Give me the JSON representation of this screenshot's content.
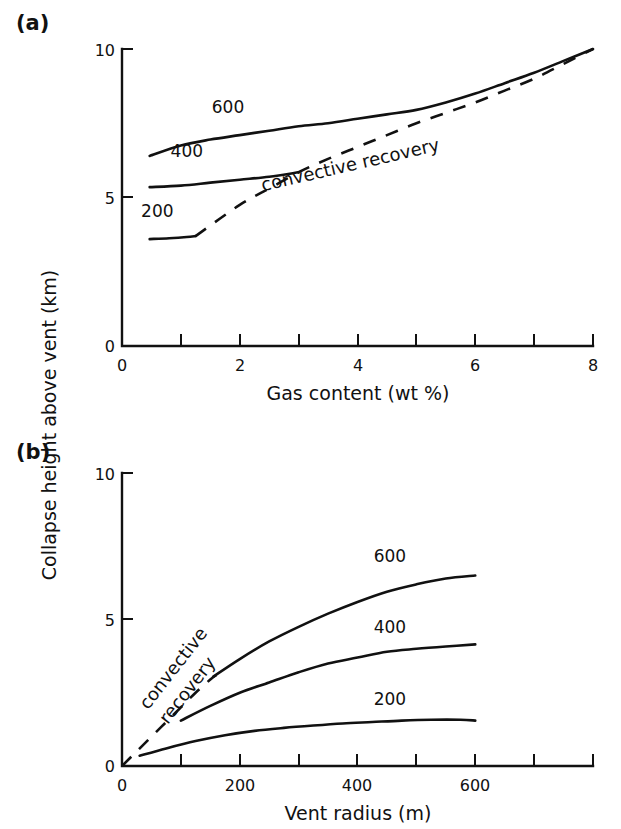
{
  "figure": {
    "panels": [
      {
        "tag": "(a)",
        "xlabel": "Gas content (wt %)",
        "xticks": [
          "0",
          "2",
          "4",
          "6",
          "8"
        ],
        "yticks": [
          "10",
          "5",
          "0"
        ],
        "annotation": "convective recovery",
        "curve_labels": [
          "600",
          "400",
          "200"
        ]
      },
      {
        "tag": "(b)",
        "xlabel": "Vent radius (m)",
        "xticks": [
          "0",
          "200",
          "400",
          "600"
        ],
        "yticks": [
          "10",
          "5",
          "0"
        ],
        "annotation_line1": "convective",
        "annotation_line2": "recovery",
        "curve_labels": [
          "600",
          "400",
          "200"
        ]
      }
    ],
    "ylabel": "Collapse height above vent (km)"
  },
  "chart_data": [
    {
      "type": "line",
      "panel": "(a)",
      "title": "",
      "xlabel": "Gas content (wt %)",
      "ylabel": "Collapse height above vent (km)",
      "xlim": [
        0,
        8
      ],
      "ylim": [
        0,
        10
      ],
      "xticks": [
        0,
        1,
        2,
        3,
        4,
        5,
        6,
        7,
        8
      ],
      "xticklabels": [
        "0",
        "",
        "2",
        "",
        "4",
        "",
        "6",
        "",
        "8"
      ],
      "yticks": [
        0,
        5,
        10
      ],
      "yticklabels": [
        "0",
        "5",
        "10"
      ],
      "grid": false,
      "legend": "inline-curve-labels",
      "series": [
        {
          "name": "600",
          "label_position": [
            1.8,
            7.85
          ],
          "x": [
            0.47,
            1.0,
            1.5,
            2.0,
            2.5,
            3.0,
            3.5,
            4.0,
            4.5,
            5.0,
            5.5,
            6.0,
            6.5,
            7.0,
            7.5,
            8.0
          ],
          "y": [
            6.4,
            6.75,
            6.95,
            7.1,
            7.25,
            7.4,
            7.5,
            7.65,
            7.8,
            7.95,
            8.2,
            8.5,
            8.85,
            9.2,
            9.6,
            10.0
          ]
        },
        {
          "name": "400",
          "label_position": [
            1.1,
            6.35
          ],
          "x": [
            0.47,
            1.0,
            1.5,
            2.0,
            2.5,
            3.0
          ],
          "y": [
            5.35,
            5.4,
            5.5,
            5.6,
            5.7,
            5.85
          ]
        },
        {
          "name": "200",
          "label_position": [
            0.6,
            4.35
          ],
          "x": [
            0.47,
            0.8,
            1.1,
            1.25
          ],
          "y": [
            3.6,
            3.63,
            3.67,
            3.7
          ]
        },
        {
          "name": "convective recovery",
          "style": "dashed",
          "label_position": [
            3.9,
            5.9
          ],
          "label_rotation_deg": -13,
          "x": [
            1.25,
            2.0,
            2.5,
            3.0,
            3.5,
            4.0,
            4.5,
            5.0,
            5.5,
            6.0,
            6.5,
            7.0,
            7.5,
            8.0
          ],
          "y": [
            3.7,
            4.75,
            5.3,
            5.85,
            6.3,
            6.7,
            7.1,
            7.5,
            7.85,
            8.2,
            8.6,
            9.0,
            9.5,
            10.0
          ]
        }
      ]
    },
    {
      "type": "line",
      "panel": "(b)",
      "title": "",
      "xlabel": "Vent radius (m)",
      "ylabel": "Collapse height above vent (km)",
      "xlim": [
        0,
        800
      ],
      "ylim": [
        0,
        10
      ],
      "xticks": [
        0,
        100,
        200,
        300,
        400,
        500,
        600,
        700,
        800
      ],
      "xticklabels": [
        "0",
        "",
        "200",
        "",
        "400",
        "",
        "600",
        "",
        ""
      ],
      "yticks": [
        0,
        5,
        10
      ],
      "yticklabels": [
        "0",
        "5",
        "10"
      ],
      "grid": false,
      "legend": "inline-curve-labels",
      "series": [
        {
          "name": "600",
          "label_position": [
            455,
            6.95
          ],
          "x": [
            155,
            200,
            250,
            300,
            350,
            400,
            450,
            500,
            550,
            600
          ],
          "y": [
            3.05,
            3.65,
            4.25,
            4.75,
            5.2,
            5.6,
            5.95,
            6.2,
            6.4,
            6.5
          ]
        },
        {
          "name": "400",
          "label_position": [
            455,
            4.55
          ],
          "x": [
            100,
            150,
            200,
            250,
            300,
            350,
            400,
            450,
            500,
            550,
            600
          ],
          "y": [
            1.55,
            2.05,
            2.5,
            2.85,
            3.2,
            3.5,
            3.7,
            3.9,
            4.0,
            4.08,
            4.15
          ]
        },
        {
          "name": "200",
          "label_position": [
            455,
            2.1
          ],
          "x": [
            30,
            75,
            125,
            175,
            225,
            275,
            325,
            375,
            425,
            475,
            525,
            575,
            600
          ],
          "y": [
            0.35,
            0.6,
            0.85,
            1.05,
            1.2,
            1.3,
            1.38,
            1.45,
            1.5,
            1.55,
            1.58,
            1.58,
            1.55
          ]
        },
        {
          "name": "convective recovery",
          "style": "dashed",
          "label_rotation_deg": -52,
          "x": [
            0,
            25,
            50,
            75,
            100,
            125,
            150,
            160
          ],
          "y": [
            0,
            0.5,
            1.0,
            1.5,
            2.0,
            2.5,
            2.95,
            3.1
          ]
        }
      ]
    }
  ]
}
